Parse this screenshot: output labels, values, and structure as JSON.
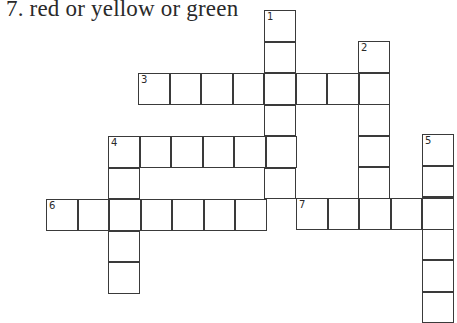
{
  "clue_text": "7. red or yellow or green",
  "cell_size": 31.5,
  "words": [
    {
      "number": "1",
      "direction": "down",
      "x": 264,
      "y": 10,
      "length": 6
    },
    {
      "number": "2",
      "direction": "down",
      "x": 358,
      "y": 41,
      "length": 5
    },
    {
      "number": "3",
      "direction": "across",
      "x": 138,
      "y": 73,
      "length": 8
    },
    {
      "number": "4",
      "direction": "across",
      "x": 108,
      "y": 136,
      "length": 6
    },
    {
      "number": "4",
      "direction": "down",
      "x": 108,
      "y": 136,
      "length": 5
    },
    {
      "number": "5",
      "direction": "down",
      "x": 422,
      "y": 134,
      "length": 6
    },
    {
      "number": "6",
      "direction": "across",
      "x": 46,
      "y": 199,
      "length": 7
    },
    {
      "number": "7",
      "direction": "across",
      "x": 296,
      "y": 198,
      "length": 5
    }
  ]
}
